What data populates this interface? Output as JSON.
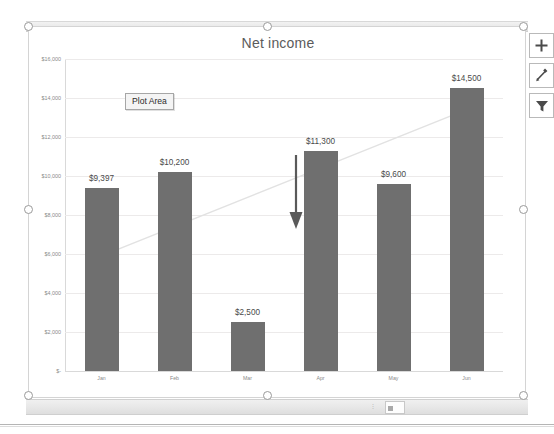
{
  "window": {
    "top_strip_label": "",
    "bottom_strip_label": ""
  },
  "chart_object": {
    "selected": true,
    "title": "Net income",
    "tooltip": {
      "label": "Plot Area"
    },
    "tools": [
      {
        "name": "chart-elements",
        "icon": "plus-icon",
        "glyph": "+",
        "tooltip": "Chart Elements"
      },
      {
        "name": "chart-styles",
        "icon": "paintbrush-icon",
        "glyph": "✎",
        "tooltip": "Chart Styles"
      },
      {
        "name": "chart-filters",
        "icon": "funnel-icon",
        "glyph": "▼",
        "tooltip": "Chart Filters"
      }
    ],
    "handles": [
      "top-left",
      "top-middle",
      "top-right",
      "middle-left",
      "middle-right",
      "bottom-left",
      "bottom-middle",
      "bottom-right"
    ]
  },
  "annotations": {
    "arrow": {
      "name": "down-arrow-annotation",
      "direction": "down",
      "points_to": "Mar"
    }
  },
  "colors": {
    "bar_fill": "#6f6f6f",
    "gridline": "#eceaea",
    "axis": "#d9d9d9",
    "title_text": "#5b5b5b",
    "label_text": "#4a4a4a",
    "tick_text": "#8a8a8a",
    "trendline": "#e2e2e2",
    "arrow": "#5a5a5a"
  },
  "chart_data": {
    "type": "bar",
    "title": "Net income",
    "xlabel": "",
    "ylabel": "",
    "categories": [
      "Jan",
      "Feb",
      "Mar",
      "Apr",
      "May",
      "Jun"
    ],
    "values": [
      9397,
      10200,
      2500,
      11300,
      9600,
      14500
    ],
    "data_labels": [
      "$9,397",
      "$10,200",
      "$2,500",
      "$11,300",
      "$9,600",
      "$14,500"
    ],
    "ylim": [
      0,
      16000
    ],
    "ytick_values": [
      0,
      2000,
      4000,
      6000,
      8000,
      10000,
      12000,
      14000,
      16000
    ],
    "ytick_labels": [
      "$-",
      "$2,000",
      "$4,000",
      "$6,000",
      "$8,000",
      "$10,000",
      "$12,000",
      "$14,000",
      "$16,000"
    ],
    "grid": true,
    "legend": false,
    "legend_position": "none",
    "series": [
      {
        "name": "Net income",
        "values": [
          9397,
          10200,
          2500,
          11300,
          9600,
          14500
        ]
      }
    ],
    "trendline": {
      "present": true,
      "type": "linear",
      "start_value": 5900,
      "end_value": 13400
    }
  }
}
